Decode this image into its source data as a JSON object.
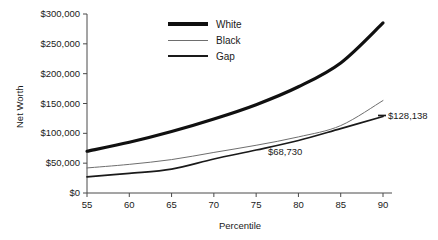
{
  "chart_data": {
    "type": "line",
    "title": "",
    "xlabel": "Percentile",
    "ylabel": "Net Worth",
    "x": [
      55,
      60,
      65,
      70,
      75,
      80,
      85,
      90
    ],
    "xlim": [
      55,
      90
    ],
    "ylim": [
      0,
      300000
    ],
    "grid": false,
    "legend_position": "top-center-right",
    "y_ticks": [
      0,
      50000,
      100000,
      150000,
      200000,
      250000,
      300000
    ],
    "y_tick_labels": [
      "$0",
      "$50,000",
      "$100,000",
      "$150,000",
      "$200,000",
      "$250,000",
      "$300,000"
    ],
    "x_tick_labels": [
      "55",
      "60",
      "65",
      "70",
      "75",
      "80",
      "85",
      "90"
    ],
    "series": [
      {
        "name": "White",
        "color": "#101010",
        "width": 3.2,
        "values": [
          70000,
          85000,
          103000,
          124000,
          148000,
          178000,
          218000,
          285000
        ]
      },
      {
        "name": "Black",
        "color": "#6e6e6e",
        "width": 1.0,
        "values": [
          42000,
          48000,
          56000,
          68000,
          80000,
          94000,
          113000,
          155000
        ]
      },
      {
        "name": "Gap",
        "color": "#1a1a1a",
        "width": 1.7,
        "values": [
          27000,
          33000,
          40000,
          57000,
          72000,
          88000,
          108000,
          128138
        ]
      }
    ],
    "annotations": [
      {
        "text": "$68,730",
        "x": 78,
        "y": 58000
      },
      {
        "text": "$128,138",
        "x": 91.2,
        "y": 128138
      }
    ]
  }
}
